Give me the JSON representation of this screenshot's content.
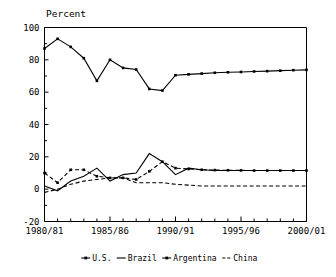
{
  "chart_data": {
    "type": "line",
    "title": "Percent",
    "xlabel": "",
    "ylabel": "",
    "ylim": [
      -20,
      100
    ],
    "yticks": [
      -20,
      0,
      20,
      40,
      60,
      80,
      100
    ],
    "ytick_labels": [
      "-20",
      "0",
      "20",
      "40",
      "60",
      "80",
      "100"
    ],
    "x": [
      "1980/81",
      "1981/82",
      "1982/83",
      "1983/84",
      "1984/85",
      "1985/86",
      "1986/87",
      "1987/88",
      "1988/89",
      "1989/90",
      "1990/91",
      "1991/92",
      "1992/93",
      "1993/94",
      "1994/95",
      "1995/96",
      "1996/97",
      "1997/98",
      "1998/99",
      "1999/00",
      "2000/01"
    ],
    "xtick_labels_shown": [
      "1980/81",
      "1985/86",
      "1990/91",
      "1995/96",
      "2000/01"
    ],
    "xtick_label_indices": [
      0,
      5,
      10,
      15,
      20
    ],
    "grid": false,
    "legend_position": "bottom",
    "series": [
      {
        "name": "U.S.",
        "style": "solid-with-markers",
        "marker": "square",
        "values": [
          87,
          93,
          88,
          81,
          67,
          80,
          75,
          74,
          62,
          61,
          70.5,
          71,
          71.5,
          72,
          72.3,
          72.5,
          72.8,
          73,
          73.3,
          73.6,
          73.8
        ]
      },
      {
        "name": "Brazil",
        "style": "solid",
        "values": [
          2,
          -1,
          5,
          8,
          13,
          5,
          9,
          10,
          22,
          17,
          9,
          13,
          12,
          11.5,
          11.5,
          11.5,
          11.5,
          11.5,
          11.5,
          11.5,
          11.5
        ]
      },
      {
        "name": "Argentina",
        "style": "dashed-with-markers",
        "marker": "square",
        "values": [
          10,
          4,
          12,
          12,
          8,
          7,
          7,
          6,
          11,
          17,
          13,
          12.5,
          12,
          11.8,
          11.7,
          11.6,
          11.5,
          11.5,
          11.5,
          11.5,
          11.5
        ]
      },
      {
        "name": "China",
        "style": "dashed",
        "values": [
          -2,
          0,
          3,
          5,
          6,
          7,
          7,
          4,
          4,
          4,
          3,
          2.5,
          2,
          2,
          2,
          2,
          2,
          2,
          2,
          2,
          2
        ]
      }
    ]
  },
  "legend": {
    "items": [
      {
        "label": "U.S.",
        "marker_glyph": "marker-square"
      },
      {
        "label": "Brazil",
        "marker_glyph": "line-solid"
      },
      {
        "label": "Argentina",
        "marker_glyph": "marker-square"
      },
      {
        "label": "China",
        "marker_glyph": "line-dashed"
      }
    ]
  }
}
